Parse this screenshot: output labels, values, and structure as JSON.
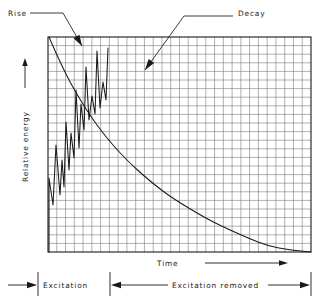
{
  "figure": {
    "background_color": "#ffffff",
    "ink_color": "#1a1a1a",
    "grid_color": "#7a7a7a"
  },
  "labels": {
    "rise": "Rise",
    "decay": "Decay",
    "y_axis": "Relative energy",
    "x_axis": "Time",
    "excitation": "Excitation",
    "excitation_removed": "Excitation removed"
  },
  "chart_data": {
    "type": "line",
    "title": "",
    "xlabel": "Time",
    "ylabel": "Relative energy",
    "grid": true,
    "legend": false,
    "annotations": [
      {
        "text": "Rise",
        "label_x": 8,
        "label_y": 14,
        "leader": [
          [
            30,
            13
          ],
          [
            63,
            13
          ],
          [
            82,
            46
          ]
        ],
        "arrow_tip": [
          82,
          46
        ],
        "arrow_angle": 60
      },
      {
        "text": "Decay",
        "label_x": 238,
        "label_y": 14,
        "leader": [
          [
            233,
            16
          ],
          [
            184,
            16
          ],
          [
            145,
            70
          ]
        ],
        "arrow_tip": [
          145,
          70
        ],
        "arrow_angle": 126
      }
    ],
    "plot_box": {
      "x0": 48,
      "y0": 37,
      "x1": 311,
      "y1": 252
    },
    "grid_cols": 30,
    "grid_rows": 25,
    "axis_ranges": {
      "xlim": [
        0,
        30
      ],
      "ylim": [
        0,
        25
      ]
    },
    "series": [
      {
        "name": "Rise (excitation sawtooth)",
        "comment": "Rising oscillatory sawtooth during excitation phase",
        "points_px": [
          [
            49,
            252
          ],
          [
            49,
            178
          ],
          [
            53,
            205
          ],
          [
            56,
            145
          ],
          [
            60,
            195
          ],
          [
            62,
            160
          ],
          [
            64,
            187
          ],
          [
            66,
            122
          ],
          [
            69,
            170
          ],
          [
            71,
            133
          ],
          [
            74,
            158
          ],
          [
            76,
            90
          ],
          [
            79,
            148
          ],
          [
            81,
            104
          ],
          [
            84,
            130
          ],
          [
            86,
            67
          ],
          [
            89,
            120
          ],
          [
            92,
            96
          ],
          [
            95,
            114
          ],
          [
            97,
            51
          ],
          [
            100,
            108
          ],
          [
            103,
            82
          ],
          [
            106,
            100
          ],
          [
            108,
            48
          ]
        ]
      },
      {
        "name": "Decay (exponential)",
        "comment": "Exponential decay after excitation removed",
        "points_px": [
          [
            49,
            37
          ],
          [
            56,
            53
          ],
          [
            63,
            68
          ],
          [
            70,
            82
          ],
          [
            78,
            96
          ],
          [
            86,
            109
          ],
          [
            94,
            121
          ],
          [
            103,
            133
          ],
          [
            112,
            144
          ],
          [
            122,
            155
          ],
          [
            132,
            165
          ],
          [
            143,
            175
          ],
          [
            155,
            185
          ],
          [
            168,
            195
          ],
          [
            182,
            204
          ],
          [
            197,
            213
          ],
          [
            213,
            222
          ],
          [
            230,
            230
          ],
          [
            248,
            238
          ],
          [
            268,
            246
          ],
          [
            290,
            250
          ],
          [
            311,
            252
          ]
        ]
      }
    ],
    "phase_markers": {
      "excitation_start_px": 10,
      "excitation_divider_px": 110,
      "excitation_end_px": 311,
      "dimension_line_y_px": 285
    },
    "time_arrow": {
      "x0": 210,
      "x1": 285,
      "y": 262
    },
    "y_arrow": {
      "x": 25,
      "y0": 62,
      "y1": 88
    }
  }
}
